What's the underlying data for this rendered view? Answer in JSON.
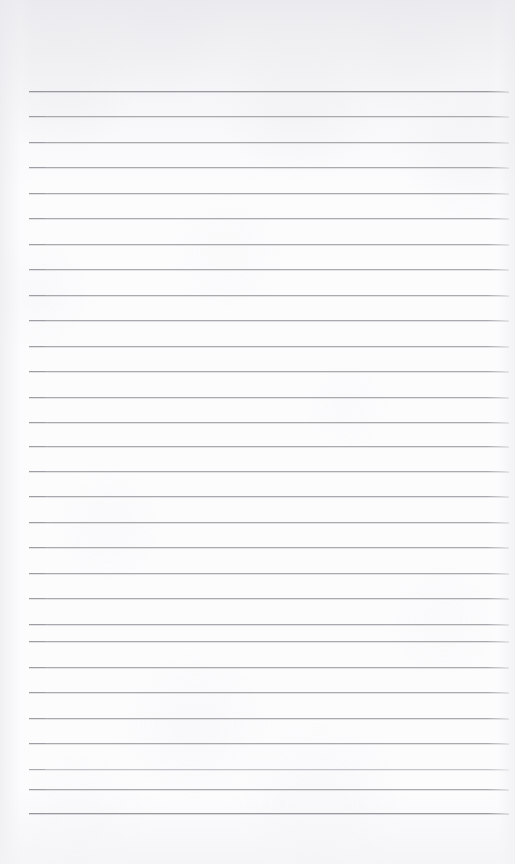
{
  "document": {
    "kind": "lined-notepad-page",
    "title": "Blank ruled notepad page",
    "content_text": "",
    "is_blank": true,
    "page_width": 515,
    "page_height": 864
  },
  "colors": {
    "paper": "#fcfcfd",
    "rule": "#a9a9ae",
    "rule_emphasis": "#9a9a9f",
    "rule_faint": "#c2c2c7",
    "top_shade": "#e8e8ec"
  },
  "ruling": {
    "style": "wide-ruled",
    "line_count": 29,
    "first_line_y": 91,
    "line_spacing": 25.8,
    "line_start_x": 29,
    "line_end_x": 509,
    "line_thickness": 1,
    "top_margin": 91,
    "bottom_margin": 51,
    "left_margin": 29,
    "right_margin": 6,
    "lines": [
      {
        "y": 91,
        "weight": "emphasis"
      },
      {
        "y": 116,
        "weight": "normal"
      },
      {
        "y": 142,
        "weight": "normal"
      },
      {
        "y": 167,
        "weight": "normal"
      },
      {
        "y": 193,
        "weight": "normal"
      },
      {
        "y": 218,
        "weight": "normal"
      },
      {
        "y": 244,
        "weight": "normal"
      },
      {
        "y": 269,
        "weight": "normal"
      },
      {
        "y": 295,
        "weight": "normal"
      },
      {
        "y": 320,
        "weight": "normal"
      },
      {
        "y": 346,
        "weight": "normal"
      },
      {
        "y": 371,
        "weight": "normal"
      },
      {
        "y": 397,
        "weight": "normal"
      },
      {
        "y": 422,
        "weight": "normal"
      },
      {
        "y": 446,
        "weight": "normal"
      },
      {
        "y": 471,
        "weight": "normal"
      },
      {
        "y": 496,
        "weight": "normal"
      },
      {
        "y": 522,
        "weight": "normal"
      },
      {
        "y": 547,
        "weight": "normal"
      },
      {
        "y": 573,
        "weight": "normal"
      },
      {
        "y": 598,
        "weight": "normal"
      },
      {
        "y": 624,
        "weight": "normal"
      },
      {
        "y": 641,
        "weight": "normal"
      },
      {
        "y": 667,
        "weight": "normal"
      },
      {
        "y": 692,
        "weight": "normal"
      },
      {
        "y": 718,
        "weight": "normal"
      },
      {
        "y": 743,
        "weight": "normal"
      },
      {
        "y": 769,
        "weight": "faint"
      },
      {
        "y": 789,
        "weight": "normal"
      },
      {
        "y": 813,
        "weight": "emphasis"
      }
    ]
  }
}
